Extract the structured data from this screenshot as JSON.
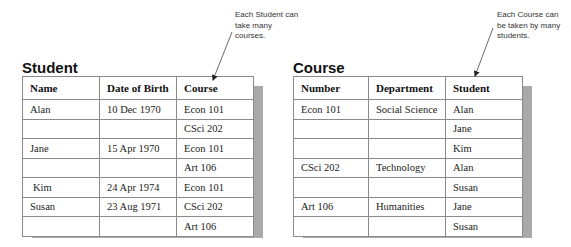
{
  "annotations": {
    "student_note": "Each Student can take many courses.",
    "student_note_lines": [
      "Each Student can",
      "take many",
      "courses."
    ],
    "course_note_lines": [
      "Each Course can",
      "be taken by many",
      "students."
    ]
  },
  "student_table": {
    "title": "Student",
    "headers": [
      "Name",
      "Date of Birth",
      "Course"
    ],
    "rows": [
      [
        "Alan",
        "10 Dec 1970",
        "Econ 101"
      ],
      [
        "",
        "",
        "CSci 202"
      ],
      [
        "Jane",
        "15 Apr 1970",
        "Econ 101"
      ],
      [
        "",
        "",
        "Art 106"
      ],
      [
        "Kim",
        "24 Apr 1974",
        "Econ 101"
      ],
      [
        "Susan",
        "23 Aug 1971",
        "CSci 202"
      ],
      [
        "",
        "",
        "Art 106"
      ]
    ]
  },
  "course_table": {
    "title": "Course",
    "headers": [
      "Number",
      "Department",
      "Student"
    ],
    "rows": [
      [
        "Econ 101",
        "Social Science",
        "Alan"
      ],
      [
        "",
        "",
        "Jane"
      ],
      [
        "",
        "",
        "Kim"
      ],
      [
        "CSci 202",
        "Technology",
        "Alan"
      ],
      [
        "",
        "",
        "Susan"
      ],
      [
        "Art 106",
        "Humanities",
        "Jane"
      ],
      [
        "",
        "",
        "Susan"
      ]
    ]
  },
  "colors": {
    "shadow": "#a9a9a9",
    "border": "#8a8a8a",
    "text": "#222222"
  }
}
